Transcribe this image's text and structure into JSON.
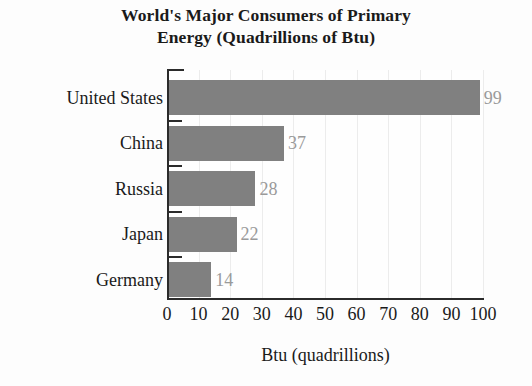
{
  "chart_data": {
    "type": "bar",
    "orientation": "horizontal",
    "title": "World's Major Consumers of Primary Energy (Quadrillions of Btu)",
    "title_lines": [
      "World's Major Consumers of Primary",
      "Energy (Quadrillions of Btu)"
    ],
    "categories": [
      "United States",
      "China",
      "Russia",
      "Japan",
      "Germany"
    ],
    "values": [
      99,
      37,
      28,
      22,
      14
    ],
    "value_labels": [
      "99",
      "37",
      "28",
      "22",
      "14"
    ],
    "xlabel": "Btu (quadrillions)",
    "ylabel": "",
    "xlim": [
      0,
      100
    ],
    "xticks": [
      0,
      10,
      20,
      30,
      40,
      50,
      60,
      70,
      80,
      90,
      100
    ],
    "xtick_labels": [
      "0",
      "10",
      "20",
      "30",
      "40",
      "50",
      "60",
      "70",
      "80",
      "90",
      "100"
    ],
    "grid": "vertical-faint",
    "legend": "none",
    "bar_color": "#808080",
    "value_label_color": "#9a9a9a",
    "axis_color": "#2b2b2b",
    "text_color": "#1a1a1a",
    "background_color": "#fdfdfd"
  }
}
